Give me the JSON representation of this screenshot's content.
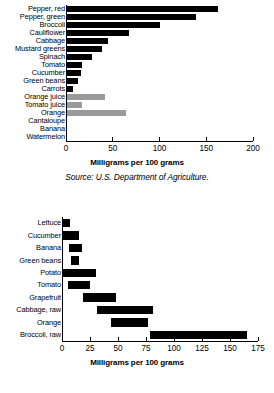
{
  "figures": [
    {
      "id": "vitamin-c-vegetables-chart",
      "axis_title": "Milligrams per 100 grams",
      "source": "Source: U.S. Department of Agriculture.",
      "chart_data": {
        "type": "bar",
        "orientation": "horizontal",
        "title": "",
        "xlabel": "Milligrams per 100 grams",
        "ylabel": "",
        "xlim": [
          0,
          200
        ],
        "xticks": [
          0,
          50,
          100,
          150,
          200
        ],
        "grid": false,
        "legend": "none",
        "colors": {
          "dark": "#000000",
          "light": "#9a9a9a"
        },
        "categories": [
          "Pepper, red",
          "Pepper, green",
          "Broccoli",
          "Cauliflower",
          "Cabbage",
          "Mustard greens",
          "Spinach",
          "Tomato",
          "Cucumber",
          "Green beans",
          "Carrots",
          "Orange juice",
          "Tomato juice",
          "Orange",
          "Cantaloupe",
          "Banana",
          "Watermelon"
        ],
        "values": [
          163,
          139,
          101,
          67,
          45,
          39,
          28,
          17,
          16,
          13,
          8,
          42,
          17,
          64,
          0,
          0,
          0
        ],
        "shades": [
          "dark",
          "dark",
          "dark",
          "dark",
          "dark",
          "dark",
          "dark",
          "dark",
          "dark",
          "dark",
          "dark",
          "light",
          "light",
          "light",
          "light",
          "light",
          "light"
        ]
      }
    },
    {
      "id": "vitamin-c-range-chart",
      "axis_title": "Milligrams per 100 grams",
      "source": "",
      "chart_data": {
        "type": "bar",
        "orientation": "horizontal",
        "subtype": "floating-range",
        "title": "",
        "xlabel": "Milligrams per 100 grams",
        "ylabel": "",
        "xlim": [
          0,
          175
        ],
        "xticks": [
          0,
          25,
          50,
          75,
          100,
          125,
          150,
          175
        ],
        "grid": false,
        "legend": "none",
        "colors": {
          "dark": "#000000"
        },
        "categories": [
          "Lettuce",
          "Cucumber",
          "Banana",
          "Green beans",
          "Potato",
          "Tomato",
          "Grapefruit",
          "Cabbage, raw",
          "Orange",
          "Broccoli, raw"
        ],
        "ranges": [
          [
            0,
            7
          ],
          [
            0,
            15
          ],
          [
            6,
            18
          ],
          [
            8,
            15
          ],
          [
            0,
            30
          ],
          [
            5,
            25
          ],
          [
            19,
            48
          ],
          [
            31,
            81
          ],
          [
            44,
            77
          ],
          [
            79,
            165
          ]
        ]
      }
    }
  ]
}
